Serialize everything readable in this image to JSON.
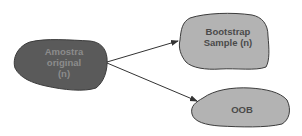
{
  "diagram": {
    "nodes": [
      {
        "id": "original",
        "label_lines": [
          "Amostra",
          "original",
          "(n)"
        ],
        "fill": "#5a5a5a",
        "text_color": "#8c8c8c"
      },
      {
        "id": "bootstrap",
        "label_lines": [
          "Bootstrap",
          "Sample (n)"
        ],
        "fill": "#b3b3b3",
        "text_color": "#4a4a4a"
      },
      {
        "id": "oob",
        "label_lines": [
          "OOB"
        ],
        "fill": "#b3b3b3",
        "text_color": "#4a4a4a"
      }
    ],
    "edges": [
      {
        "from": "original",
        "to": "bootstrap"
      },
      {
        "from": "original",
        "to": "oob"
      }
    ],
    "colors": {
      "outline": "#3c3c3c",
      "arrow": "#333333",
      "background": "#ffffff"
    }
  }
}
